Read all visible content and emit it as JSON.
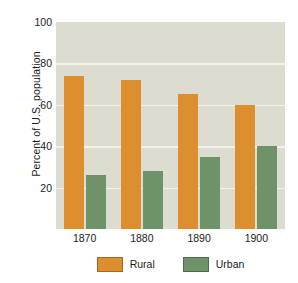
{
  "chart_data": {
    "type": "bar",
    "title": "",
    "subtitle": "",
    "xlabel": "",
    "ylabel": "Percent of U.S. population",
    "categories": [
      "1870",
      "1880",
      "1890",
      "1900"
    ],
    "series": [
      {
        "name": "Rural",
        "color": "#dd8e2e",
        "values": [
          74,
          72,
          65,
          60
        ]
      },
      {
        "name": "Urban",
        "color": "#6f9369",
        "values": [
          26,
          28,
          35,
          40
        ]
      }
    ],
    "ylim": [
      0,
      100
    ],
    "yticks": [
      20,
      40,
      60,
      80,
      100
    ],
    "ytick_labels": [
      "20",
      "40",
      "60",
      "80",
      "100"
    ],
    "grid": true,
    "legend_position": "bottom",
    "plot_background": "#dcddd0",
    "gridline_color": "#f3f3ec",
    "annotations": []
  },
  "legend": {
    "entries": [
      {
        "label": "Rural"
      },
      {
        "label": "Urban"
      }
    ]
  }
}
